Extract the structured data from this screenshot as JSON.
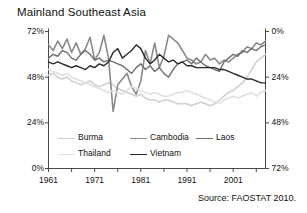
{
  "title": "Mainland Southeast Asia",
  "source": "Source: FAOSTAT 2010.",
  "axes": {
    "y_left_ticks": [
      "72%",
      "48%",
      "24%",
      "0%"
    ],
    "y_right_ticks": [
      "72%",
      "48%",
      "24%",
      "0%"
    ],
    "x_ticks": [
      "1961",
      "1971",
      "1981",
      "1991",
      "2001"
    ]
  },
  "legend": {
    "items": [
      {
        "label": "Burma",
        "color": "#d0d0d0",
        "width": 1.6
      },
      {
        "label": "Cambodia",
        "color": "#8a8a8a",
        "width": 1.6
      },
      {
        "label": "Laos",
        "color": "#6e6e6e",
        "width": 1.4
      },
      {
        "label": "Thailand",
        "color": "#e0e0e0",
        "width": 1.6
      },
      {
        "label": "Vietnam",
        "color": "#2b2b2b",
        "width": 1.4
      }
    ]
  },
  "chart_data": {
    "type": "line",
    "title": "Mainland Southeast Asia",
    "xlabel": "",
    "ylabel": "",
    "ylim": [
      0,
      72
    ],
    "xlim": [
      1961,
      2008
    ],
    "ytick_values": [
      0,
      24,
      48,
      72
    ],
    "ytick_labels": [
      "0%",
      "24%",
      "48%",
      "72%"
    ],
    "xtick_values": [
      1961,
      1971,
      1981,
      1991,
      2001
    ],
    "xtick_labels": [
      "1961",
      "1971",
      "1981",
      "1991",
      "2001"
    ],
    "minor_xticks_every": 5,
    "grid": false,
    "legend_position": "inside-bottom",
    "units": "percent",
    "x": [
      1961,
      1962,
      1963,
      1964,
      1965,
      1966,
      1967,
      1968,
      1969,
      1970,
      1971,
      1972,
      1973,
      1974,
      1975,
      1976,
      1977,
      1978,
      1979,
      1980,
      1981,
      1982,
      1983,
      1984,
      1985,
      1986,
      1987,
      1988,
      1989,
      1990,
      1991,
      1992,
      1993,
      1994,
      1995,
      1996,
      1997,
      1998,
      1999,
      2000,
      2001,
      2002,
      2003,
      2004,
      2005,
      2006,
      2007,
      2008
    ],
    "series": [
      {
        "name": "Burma",
        "color": "#d0d0d0",
        "values": [
          49,
          50,
          48,
          47,
          48,
          46,
          45,
          44,
          45,
          46,
          44,
          43,
          44,
          45,
          44,
          42,
          41,
          40,
          39,
          38,
          39,
          37,
          36,
          36,
          35,
          36,
          36,
          35,
          34,
          34,
          34,
          33,
          34,
          35,
          34,
          33,
          34,
          36,
          38,
          40,
          41,
          43,
          45,
          48,
          52,
          56,
          58,
          60
        ]
      },
      {
        "name": "Cambodia",
        "color": "#8a8a8a",
        "values": [
          65,
          62,
          67,
          63,
          68,
          61,
          66,
          60,
          63,
          69,
          57,
          61,
          70,
          58,
          30,
          44,
          47,
          50,
          43,
          39,
          46,
          62,
          55,
          66,
          53,
          59,
          70,
          68,
          66,
          62,
          58,
          57,
          55,
          56,
          60,
          57,
          58,
          55,
          57,
          56,
          58,
          60,
          61,
          64,
          63,
          66,
          65,
          67
        ]
      },
      {
        "name": "Laos",
        "color": "#6e6e6e",
        "values": [
          58,
          60,
          59,
          62,
          61,
          58,
          57,
          60,
          62,
          60,
          57,
          58,
          56,
          57,
          56,
          55,
          54,
          52,
          50,
          53,
          55,
          52,
          54,
          51,
          53,
          50,
          48,
          52,
          55,
          56,
          57,
          55,
          58,
          56,
          54,
          53,
          52,
          51,
          56,
          58,
          60,
          59,
          62,
          61,
          63,
          62,
          64,
          65
        ]
      },
      {
        "name": "Thailand",
        "color": "#e0e0e0",
        "values": [
          52,
          51,
          50,
          49,
          50,
          48,
          47,
          46,
          45,
          44,
          43,
          42,
          41,
          40,
          41,
          40,
          39,
          41,
          43,
          42,
          41,
          40,
          39,
          40,
          39,
          38,
          38,
          39,
          40,
          40,
          41,
          40,
          39,
          38,
          37,
          36,
          35,
          34,
          36,
          37,
          38,
          37,
          38,
          39,
          40,
          38,
          40,
          41
        ]
      },
      {
        "name": "Vietnam",
        "color": "#2b2b2b",
        "values": [
          56,
          55,
          56,
          55,
          54,
          53,
          54,
          53,
          52,
          54,
          53,
          55,
          54,
          56,
          61,
          63,
          58,
          60,
          62,
          65,
          63,
          58,
          55,
          57,
          60,
          58,
          56,
          57,
          55,
          56,
          54,
          54,
          53,
          53,
          53,
          53,
          53,
          52,
          52,
          51,
          50,
          49,
          48,
          47,
          47,
          46,
          45,
          45
        ]
      }
    ]
  }
}
